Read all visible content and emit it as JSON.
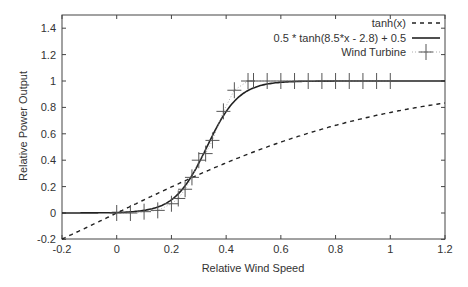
{
  "chart_data": {
    "type": "line",
    "title": "",
    "xlabel": "Relative Wind Speed",
    "ylabel": "Relative Power Output",
    "xlim": [
      -0.2,
      1.2
    ],
    "ylim": [
      -0.2,
      1.5
    ],
    "xticks": [
      "-0.2",
      "0",
      "0.2",
      "0.4",
      "0.6",
      "0.8",
      "1",
      "1.2"
    ],
    "yticks": [
      "-0.2",
      "0",
      "0.2",
      "0.4",
      "0.6",
      "0.8",
      "1",
      "1.2",
      "1.4"
    ],
    "grid": false,
    "legend_position": "top-right",
    "series": [
      {
        "name": "tanh(x)",
        "style": "dashed",
        "function": "tanh(x)"
      },
      {
        "name": "0.5 * tanh(8.5*x - 2.8) + 0.5",
        "style": "solid",
        "function": "0.5*tanh(8.5*x-2.8)+0.5"
      },
      {
        "name": "Wind Turbine",
        "style": "points-plus-dotted",
        "x": [
          0,
          0.05,
          0.1,
          0.15,
          0.2,
          0.225,
          0.25,
          0.275,
          0.3,
          0.325,
          0.35,
          0.39,
          0.43,
          0.48,
          0.5,
          0.55,
          0.6,
          0.65,
          0.7,
          0.75,
          0.8,
          0.85,
          0.9,
          0.95,
          1.0
        ],
        "y": [
          0,
          0,
          0.01,
          0.02,
          0.07,
          0.11,
          0.18,
          0.27,
          0.4,
          0.45,
          0.55,
          0.77,
          0.93,
          1.0,
          1.0,
          1.0,
          1.0,
          1.0,
          1.0,
          1.0,
          1.0,
          1.0,
          1.0,
          1.0,
          1.0
        ]
      }
    ]
  }
}
